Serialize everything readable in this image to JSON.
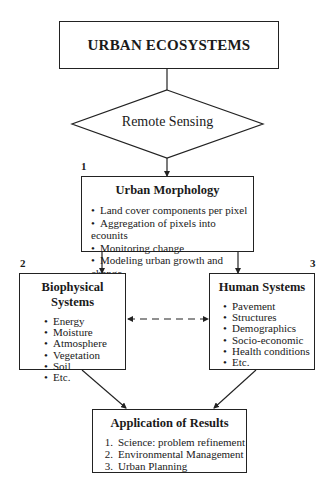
{
  "diagram": {
    "root": {
      "label": "URBAN ECOSYSTEMS"
    },
    "decision": {
      "label": "Remote Sensing"
    },
    "nodes": [
      {
        "number": "1",
        "title": "Urban Morphology",
        "items": [
          "Land cover components per pixel",
          "Aggregation of pixels into ecounits",
          "Monitoring change",
          "Modeling urban growth and change"
        ]
      },
      {
        "number": "2",
        "title": "Biophysical Systems",
        "items": [
          "Energy",
          "Moisture",
          "Atmosphere",
          "Vegetation",
          "Soil",
          "Etc."
        ]
      },
      {
        "number": "3",
        "title": "Human Systems",
        "items": [
          "Pavement",
          "Structures",
          "Demographics",
          "Socio-economic",
          "Health conditions",
          "Etc."
        ]
      }
    ],
    "results": {
      "title": "Application of Results",
      "items": [
        {
          "index": "1.",
          "text": "Science: problem refinement"
        },
        {
          "index": "2.",
          "text": "Environmental Management"
        },
        {
          "index": "3.",
          "text": "Urban Planning"
        }
      ]
    },
    "edges": [
      {
        "from": "URBAN ECOSYSTEMS",
        "to": "Remote Sensing",
        "style": "solid",
        "arrow": "none"
      },
      {
        "from": "Remote Sensing",
        "to": "Urban Morphology",
        "style": "solid",
        "arrow": "end"
      },
      {
        "from": "Urban Morphology",
        "to": "Biophysical Systems",
        "style": "solid",
        "arrow": "end"
      },
      {
        "from": "Urban Morphology",
        "to": "Human Systems",
        "style": "solid",
        "arrow": "end"
      },
      {
        "from": "Biophysical Systems",
        "to": "Human Systems",
        "style": "dashed",
        "arrow": "both"
      },
      {
        "from": "Biophysical Systems",
        "to": "Application of Results",
        "style": "solid",
        "arrow": "end"
      },
      {
        "from": "Human Systems",
        "to": "Application of Results",
        "style": "solid",
        "arrow": "end"
      }
    ],
    "colors": {
      "stroke": "#222222",
      "background": "#ffffff",
      "text": "#1a1a1a"
    }
  }
}
